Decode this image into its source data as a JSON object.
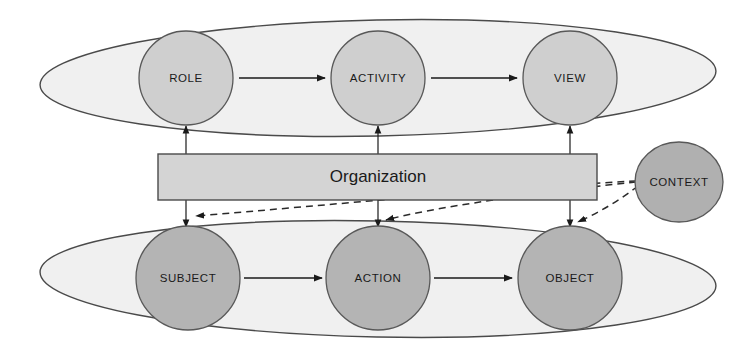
{
  "diagram": {
    "central_box": {
      "label": "Organization",
      "fill": "#d4d4d4",
      "stroke": "#4a4a4a"
    },
    "groups": [
      {
        "id": "upper-group",
        "name": "upper-abstraction-group",
        "fill": "#f0f0f0",
        "stroke": "#4a4a4a",
        "nodes": [
          {
            "id": "role",
            "label": "ROLE",
            "fill": "#cfcfcf"
          },
          {
            "id": "activity",
            "label": "ACTIVITY",
            "fill": "#cfcfcf"
          },
          {
            "id": "view",
            "label": "VIEW",
            "fill": "#cfcfcf"
          }
        ]
      },
      {
        "id": "lower-group",
        "name": "lower-concrete-group",
        "fill": "#f0f0f0",
        "stroke": "#4a4a4a",
        "nodes": [
          {
            "id": "subject",
            "label": "SUBJECT",
            "fill": "#b4b4b4"
          },
          {
            "id": "action",
            "label": "ACTION",
            "fill": "#b4b4b4"
          },
          {
            "id": "object",
            "label": "OBJECT",
            "fill": "#b4b4b4"
          }
        ]
      }
    ],
    "context_node": {
      "id": "context",
      "label": "CONTEXT",
      "fill": "#b0b0b0",
      "stroke": "#585858"
    },
    "flow_arrows": [
      {
        "from": "ROLE",
        "to": "ACTIVITY",
        "style": "solid"
      },
      {
        "from": "ACTIVITY",
        "to": "VIEW",
        "style": "solid"
      },
      {
        "from": "SUBJECT",
        "to": "ACTION",
        "style": "solid"
      },
      {
        "from": "ACTION",
        "to": "OBJECT",
        "style": "solid"
      }
    ],
    "organization_links": [
      {
        "from": "Organization",
        "to": "ROLE",
        "direction": "up",
        "style": "solid"
      },
      {
        "from": "Organization",
        "to": "ACTIVITY",
        "direction": "up",
        "style": "solid"
      },
      {
        "from": "Organization",
        "to": "VIEW",
        "direction": "up",
        "style": "solid"
      },
      {
        "from": "Organization",
        "to": "SUBJECT",
        "direction": "down",
        "style": "solid"
      },
      {
        "from": "Organization",
        "to": "ACTION",
        "direction": "down",
        "style": "solid"
      },
      {
        "from": "Organization",
        "to": "OBJECT",
        "direction": "down",
        "style": "solid"
      }
    ],
    "context_links": [
      {
        "from": "CONTEXT",
        "to": "SUBJECT",
        "style": "dashed"
      },
      {
        "from": "CONTEXT",
        "to": "ACTION",
        "style": "dashed"
      },
      {
        "from": "CONTEXT",
        "to": "OBJECT",
        "style": "dashed"
      }
    ]
  }
}
